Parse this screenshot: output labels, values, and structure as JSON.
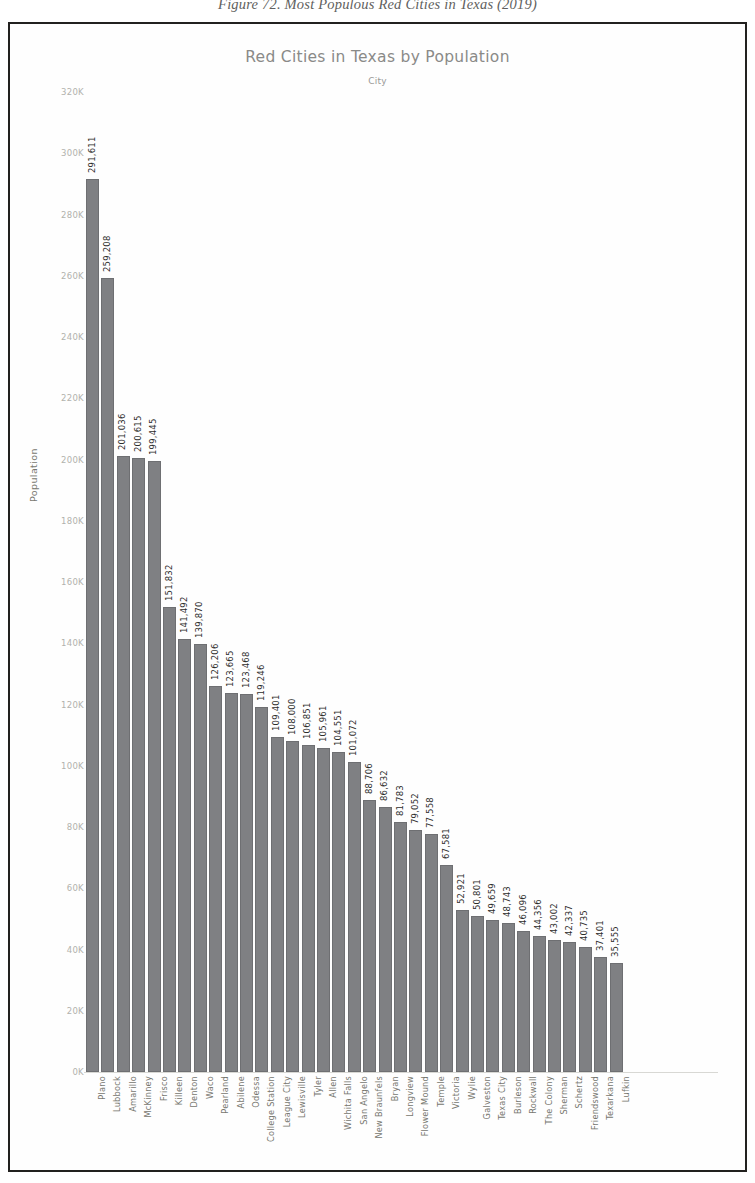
{
  "figure": {
    "caption": "Figure 72. Most Populous Red Cities in Texas (2019)"
  },
  "chart_data": {
    "type": "bar",
    "title": "Red Cities in Texas by Population",
    "subtitle": "City",
    "xlabel": "City",
    "ylabel": "Population",
    "ylim": [
      0,
      320000
    ],
    "ytick_labels": [
      "320K",
      "300K",
      "280K",
      "260K",
      "240K",
      "220K",
      "200K",
      "180K",
      "160K",
      "140K",
      "120K",
      "100K",
      "80K",
      "60K",
      "40K",
      "20K",
      "0K"
    ],
    "ytick_values": [
      320000,
      300000,
      280000,
      260000,
      240000,
      220000,
      200000,
      180000,
      160000,
      140000,
      120000,
      100000,
      80000,
      60000,
      40000,
      20000,
      0
    ],
    "grid": false,
    "legend": "none",
    "bar_color": "#7f8083",
    "categories": [
      "Plano",
      "Lubbock",
      "Amarillo",
      "McKinney",
      "Frisco",
      "Killeen",
      "Denton",
      "Waco",
      "Pearland",
      "Abilene",
      "Odessa",
      "College Station",
      "League City",
      "Lewisville",
      "Tyler",
      "Allen",
      "Wichita Falls",
      "San Angelo",
      "New Braunfels",
      "Bryan",
      "Longview",
      "Flower Mound",
      "Temple",
      "Victoria",
      "Wylie",
      "Galveston",
      "Texas City",
      "Burleson",
      "Rockwall",
      "The Colony",
      "Sherman",
      "Schertz",
      "Friendswood",
      "Texarkana",
      "Lufkin"
    ],
    "values": [
      291611,
      259208,
      201036,
      200615,
      199445,
      151832,
      141492,
      139870,
      126206,
      123665,
      123468,
      119246,
      109401,
      108000,
      106851,
      105961,
      104551,
      101072,
      88706,
      86632,
      81783,
      79052,
      77558,
      67581,
      52921,
      50801,
      49659,
      48743,
      46096,
      44356,
      43002,
      42337,
      40735,
      37401,
      35555
    ],
    "value_labels": [
      "291,611",
      "259,208",
      "201,036",
      "200,615",
      "199,445",
      "151,832",
      "141,492",
      "139,870",
      "126,206",
      "123,665",
      "123,468",
      "119,246",
      "109,401",
      "108,000",
      "106,851",
      "105,961",
      "104,551",
      "101,072",
      "88,706",
      "86,632",
      "81,783",
      "79,052",
      "77,558",
      "67,581",
      "52,921",
      "50,801",
      "49,659",
      "48,743",
      "46,096",
      "44,356",
      "43,002",
      "42,337",
      "40,735",
      "37,401",
      "35,555"
    ]
  }
}
